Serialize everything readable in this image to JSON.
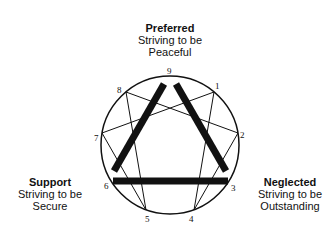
{
  "diagram": {
    "type": "enneagram",
    "top": {
      "title": "Preferred",
      "line1": "Striving to be",
      "line2": "Peaceful"
    },
    "left": {
      "title": "Support",
      "line1": "Striving to be",
      "line2": "Secure"
    },
    "right": {
      "title": "Neglected",
      "line1": "Striving to be",
      "line2": "Outstanding"
    },
    "points": {
      "p9": "9",
      "p1": "1",
      "p2": "2",
      "p3": "3",
      "p4": "4",
      "p5": "5",
      "p6": "6",
      "p7": "7",
      "p8": "8"
    },
    "colors": {
      "stroke": "#111111",
      "background": "#ffffff"
    },
    "thick_edges": [
      "9-6",
      "9-3",
      "6-3"
    ],
    "thin_edges": [
      "1-4",
      "4-2",
      "2-8",
      "8-5",
      "5-7",
      "7-1"
    ]
  }
}
